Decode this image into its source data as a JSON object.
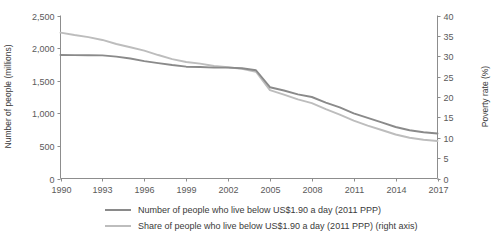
{
  "chart_data": {
    "type": "line",
    "title": "",
    "subtitle": "",
    "xlabel": "",
    "ylabel": "Number of people (millions)",
    "y2label": "Poverty rate (%)",
    "grid": false,
    "legend_position": "bottom",
    "x": [
      1990,
      1991,
      1992,
      1993,
      1994,
      1995,
      1996,
      1997,
      1998,
      1999,
      2000,
      2001,
      2002,
      2003,
      2004,
      2005,
      2006,
      2007,
      2008,
      2009,
      2010,
      2011,
      2012,
      2013,
      2014,
      2015,
      2016,
      2017
    ],
    "xlim": [
      1990,
      2017
    ],
    "xticks": [
      1990,
      1993,
      1996,
      1999,
      2002,
      2005,
      2008,
      2011,
      2014,
      2017
    ],
    "xticklabels": [
      "1990",
      "1993",
      "1996",
      "1999",
      "2002",
      "2005",
      "2008",
      "2011",
      "2014",
      "2017"
    ],
    "ylim": [
      0,
      2500
    ],
    "yticks": [
      0,
      500,
      1000,
      1500,
      2000,
      2500
    ],
    "yticklabels": [
      "0",
      "500",
      "1,000",
      "1,500",
      "2,000",
      "2,500"
    ],
    "y2lim": [
      0,
      40
    ],
    "y2ticks": [
      0,
      5,
      10,
      15,
      20,
      25,
      30,
      35,
      40
    ],
    "y2ticklabels": [
      "0",
      "5",
      "10",
      "15",
      "20",
      "25",
      "30",
      "35",
      "40"
    ],
    "series": [
      {
        "name": "Number of people who live below US$1.90 a day (2011 PPP)",
        "axis": "left",
        "color": "#8a8a8a",
        "values": [
          1895,
          1893,
          1890,
          1888,
          1870,
          1840,
          1800,
          1770,
          1740,
          1715,
          1710,
          1700,
          1700,
          1690,
          1660,
          1400,
          1350,
          1290,
          1250,
          1165,
          1090,
          1000,
          930,
          860,
          790,
          740,
          710,
          690
        ]
      },
      {
        "name": "Share of people who live below US$1.90 a day (2011 PPP) (right axis)",
        "axis": "right",
        "color": "#bdbdbd",
        "values": [
          35.8,
          35.2,
          34.7,
          34.0,
          33.0,
          32.2,
          31.4,
          30.3,
          29.3,
          28.6,
          28.2,
          27.6,
          27.3,
          26.9,
          26.2,
          21.7,
          20.6,
          19.4,
          18.5,
          17.0,
          15.7,
          14.2,
          13.0,
          11.9,
          10.8,
          10.0,
          9.5,
          9.2
        ]
      }
    ]
  },
  "legend": {
    "items": [
      {
        "label": "Number of people who live below US$1.90 a day (2011 PPP)",
        "color": "#8a8a8a"
      },
      {
        "label": "Share of people who live below US$1.90 a day (2011 PPP) (right axis)",
        "color": "#bdbdbd"
      }
    ]
  }
}
